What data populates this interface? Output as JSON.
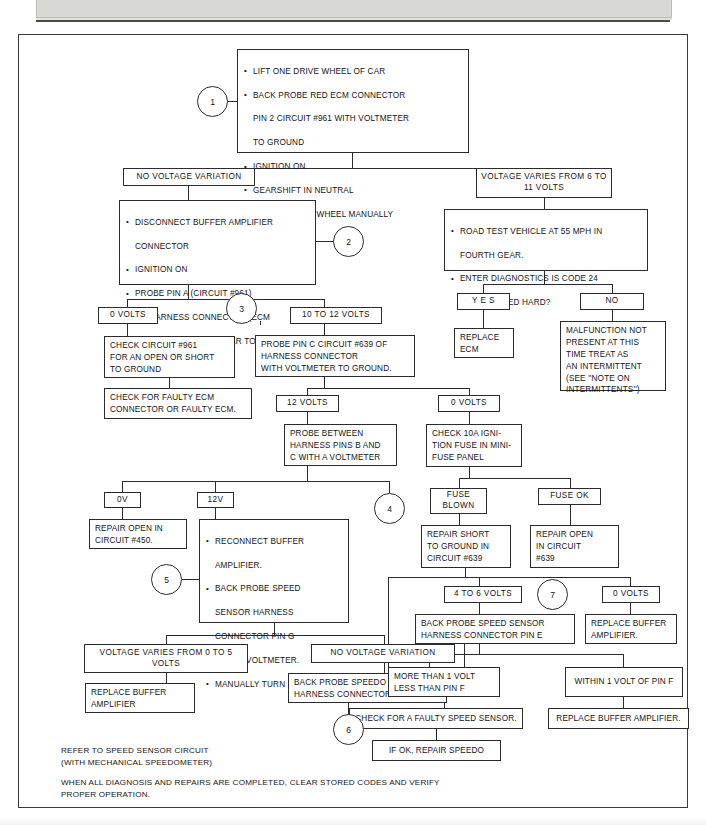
{
  "header": {
    "title": "(FOR VEHICLES WITHOUT DIGITAL CLUSTER)"
  },
  "markers": {
    "m1": "1",
    "m2": "2",
    "m3": "3",
    "m4": "4",
    "m5": "5",
    "m6": "6",
    "m7": "7"
  },
  "nodes": {
    "step1": {
      "bullets": [
        "LIFT ONE DRIVE WHEEL OF CAR",
        "BACK PROBE RED ECM CONNECTOR",
        "IGNITION ON",
        "GEARSHIFT IN NEUTRAL",
        "ROTATE DRIVE WHEEL MANUALLY"
      ],
      "cont": [
        "PIN 2 CIRCUIT #961 WITH VOLTMETER",
        "TO GROUND"
      ]
    },
    "no_voltage_variation_1": "NO VOLTAGE VARIATION",
    "voltage_varies_6_11": "VOLTAGE VARIES FROM\n6 TO 11 VOLTS",
    "step2": {
      "bullets": [
        "DISCONNECT BUFFER AMPLIFIER",
        "IGNITION ON",
        "PROBE PIN A (CIRCUIT #961)"
      ],
      "cont1": [
        "CONNECTOR"
      ],
      "cont3": [
        "OF HARNESS CONNECTOR (ECM",
        "SIDE) WITH A VOLTMETER TO",
        "GROUND."
      ]
    },
    "road_test": {
      "bullets": [
        "ROAD TEST VEHICLE AT 55 MPH IN",
        "ENTER DIAGNOSTICS  IS CODE 24"
      ],
      "cont1": [
        "FOURTH GEAR."
      ],
      "cont2": [
        "STILL STORED HARD?"
      ]
    },
    "yes": "Y E S",
    "no": "NO",
    "replace_ecm": "REPLACE\nECM",
    "malfunction_not_present": "MALFUNCTION NOT\nPRESENT AT THIS\nTIME  TREAT AS\nAN INTERMITTENT\n(SEE ''NOTE ON\nINTERMITTENTS'')",
    "zero_volts_a": "0 VOLTS",
    "ten_to_twelve": "10 TO 12 VOLTS",
    "check_circuit_961": "CHECK CIRCUIT #961\nFOR AN OPEN OR SHORT\nTO GROUND",
    "check_faulty_ecm": "CHECK FOR FAULTY ECM\nCONNECTOR OR FAULTY ECM.",
    "probe_pin_c": "PROBE PIN C CIRCUIT #639 OF\nHARNESS CONNECTOR\nWITH VOLTMETER TO GROUND.",
    "twelve_volts": "12 VOLTS",
    "zero_volts_b": "0 VOLTS",
    "probe_between": "PROBE BETWEEN\nHARNESS PINS B AND\nC WITH A VOLTMETER",
    "check_fuse": "CHECK  10A IGNI-\nTION FUSE IN MINI-\nFUSE PANEL",
    "fuse_blown": "FUSE\nBLOWN",
    "fuse_ok": "FUSE OK",
    "repair_short": "REPAIR SHORT\nTO GROUND IN\nCIRCUIT #639",
    "repair_open_639": "REPAIR OPEN\nIN CIRCUIT\n#639",
    "ov": "0V",
    "twelve_v": "12V",
    "repair_open_450": "REPAIR OPEN IN\nCIRCUIT #450.",
    "step5": {
      "bullets": [
        "RECONNECT BUFFER",
        "BACK PROBE SPEED",
        "MANUALLY TURN SPEEDO."
      ],
      "cont1": [
        "AMPLIFIER."
      ],
      "cont2": [
        "SENSOR HARNESS",
        "CONNECTOR PIN G",
        "WITH A VOLTMETER."
      ]
    },
    "voltage_varies_0_5": "VOLTAGE VARIES FROM\n0 TO 5 VOLTS",
    "no_voltage_variation_2": "NO VOLTAGE VARIATION",
    "replace_buffer_amp_1": "REPLACE BUFFER\nAMPLIFIER",
    "back_probe_pin_f": "BACK PROBE SPEEDO SENSOR\nHARNESS CONNECTOR PIN F",
    "four_to_six": "4 TO 6 VOLTS",
    "zero_volts_c": "0 VOLTS",
    "back_probe_pin_e": "BACK PROBE SPEED SENSOR\nHARNESS CONNECTOR PIN E",
    "replace_buffer_amp_2": "REPLACE BUFFER\nAMPLIFIER.",
    "more_than_1v": "MORE THAN 1 VOLT\nLESS THAN PIN F",
    "within_1v": "WITHIN 1 VOLT OF PIN F",
    "check_faulty_speed_sensor": "CHECK FOR A FAULTY SPEED SENSOR.",
    "replace_buffer_amp_3": "REPLACE BUFFER AMPLIFIER.",
    "if_ok_repair_speedo": "IF OK, REPAIR SPEEDO"
  },
  "notes": {
    "refer": "REFER TO  SPEED SENSOR CIRCUIT\n(WITH MECHANICAL SPEEDOMETER)",
    "verify": "WHEN ALL DIAGNOSIS AND REPAIRS ARE COMPLETED, CLEAR STORED CODES AND VERIFY\nPROPER OPERATION."
  },
  "colors": {
    "ink": "#2b2b2b",
    "paper": "#ffffff",
    "header_band": "#d8d8d4"
  }
}
